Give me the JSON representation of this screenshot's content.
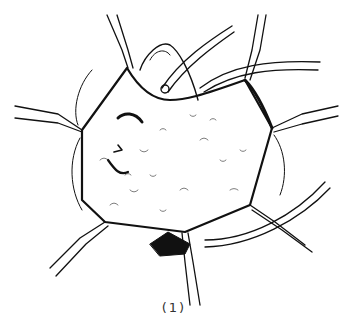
{
  "figure": {
    "type": "surgical-line-illustration",
    "style": "black ink line drawing on white",
    "caption": "(1)",
    "colors": {
      "ink": "#111111",
      "background": "#ffffff"
    },
    "elements": [
      {
        "name": "tissue-surface",
        "count": 1
      },
      {
        "name": "retractor",
        "count": 6
      },
      {
        "name": "drain-tube",
        "count": 1
      },
      {
        "name": "curved-tube",
        "count": 2
      }
    ]
  }
}
